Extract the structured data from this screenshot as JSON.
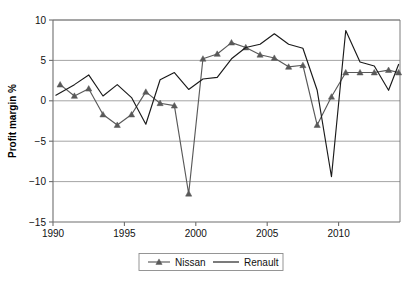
{
  "chart_data": {
    "type": "line",
    "title": "",
    "subtitle": "",
    "xlabel": "",
    "ylabel": "Profit margin %",
    "xlim": [
      1990,
      2014.3
    ],
    "ylim": [
      -15,
      10
    ],
    "yticks": [
      10,
      5,
      0,
      -5,
      -10,
      -15
    ],
    "ytick_labels": [
      "10",
      "5",
      "0",
      "−5",
      "−10",
      "−15"
    ],
    "xticks": [
      1990,
      1995,
      2000,
      2005,
      2010
    ],
    "xtick_labels": [
      "1990",
      "1995",
      "2000",
      "2005",
      "2010"
    ],
    "grid": "horizontal",
    "legend_position": "bottom",
    "series": [
      {
        "name": "Nissan",
        "color": "#595959",
        "marker": "triangle",
        "points": [
          [
            1990.5,
            2.0
          ],
          [
            1991.5,
            0.6
          ],
          [
            1992.5,
            1.5
          ],
          [
            1993.5,
            -1.7
          ],
          [
            1994.5,
            -3.0
          ],
          [
            1995.5,
            -1.7
          ],
          [
            1996.5,
            1.1
          ],
          [
            1997.5,
            -0.3
          ],
          [
            1998.5,
            -0.6
          ],
          [
            1999.5,
            -11.5
          ],
          [
            2000.5,
            5.2
          ],
          [
            2001.5,
            5.8
          ],
          [
            2002.5,
            7.2
          ],
          [
            2003.5,
            6.6
          ],
          [
            2004.5,
            5.7
          ],
          [
            2005.5,
            5.3
          ],
          [
            2006.5,
            4.2
          ],
          [
            2007.5,
            4.4
          ],
          [
            2008.5,
            -3.0
          ],
          [
            2009.5,
            0.5
          ],
          [
            2010.5,
            3.5
          ],
          [
            2011.5,
            3.5
          ],
          [
            2012.5,
            3.5
          ],
          [
            2013.5,
            3.8
          ],
          [
            2014.2,
            3.5
          ]
        ]
      },
      {
        "name": "Renault",
        "color": "#1a1a1a",
        "marker": "none",
        "points": [
          [
            1990.2,
            0.7
          ],
          [
            1991.5,
            2.0
          ],
          [
            1992.5,
            3.2
          ],
          [
            1993.5,
            0.6
          ],
          [
            1994.5,
            2.0
          ],
          [
            1995.5,
            0.4
          ],
          [
            1996.5,
            -2.9
          ],
          [
            1997.5,
            2.6
          ],
          [
            1998.5,
            3.5
          ],
          [
            1999.5,
            1.4
          ],
          [
            2000.5,
            2.7
          ],
          [
            2001.5,
            2.9
          ],
          [
            2002.5,
            5.2
          ],
          [
            2003.5,
            6.6
          ],
          [
            2004.5,
            7.0
          ],
          [
            2005.5,
            8.3
          ],
          [
            2006.5,
            7.0
          ],
          [
            2007.5,
            6.5
          ],
          [
            2008.5,
            1.3
          ],
          [
            2009.5,
            -9.4
          ],
          [
            2010.5,
            8.7
          ],
          [
            2011.5,
            4.8
          ],
          [
            2012.5,
            4.3
          ],
          [
            2013.5,
            1.3
          ],
          [
            2014.2,
            4.5
          ]
        ]
      }
    ],
    "annotations": []
  },
  "axis": {
    "y_title": "Profit margin %",
    "y_labels": [
      "10",
      "5",
      "0",
      "−5",
      "−10",
      "−15"
    ],
    "x_labels": [
      "1990",
      "1995",
      "2000",
      "2005",
      "2010"
    ]
  },
  "legend": {
    "items": [
      {
        "label": "Nissan",
        "color": "#595959",
        "marker": "triangle"
      },
      {
        "label": "Renault",
        "color": "#1a1a1a",
        "marker": "none"
      }
    ]
  },
  "colors": {
    "nissan": "#595959",
    "renault": "#1a1a1a",
    "grid": "#9a9a9a",
    "axis": "#6e6e6e",
    "background": "#ffffff"
  }
}
